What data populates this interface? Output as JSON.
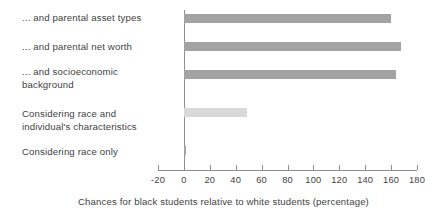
{
  "chart_data": {
    "type": "bar",
    "orientation": "horizontal",
    "title": "",
    "subtitle": "",
    "xlabel": "Chances for black students relative to white students (percentage)",
    "ylabel": "",
    "categories": [
      "... and parental asset types",
      "... and parental net worth",
      "...  and socioeconomic\nbackground",
      "Considering race and\nindividual's characteristics",
      "Considering race only"
    ],
    "values": [
      160,
      168,
      164,
      49,
      2
    ],
    "bar_colors": [
      "#a3a3a3",
      "#a3a3a3",
      "#a3a3a3",
      "#d9d9d9",
      "#a3a3a3"
    ],
    "xlim": [
      -20,
      180
    ],
    "xticks": [
      -20,
      0,
      20,
      40,
      60,
      80,
      100,
      120,
      140,
      160,
      180
    ],
    "xtick_labels": [
      "-20",
      "0",
      "20",
      "40",
      "60",
      "80",
      "100",
      "120",
      "140",
      "160",
      "180"
    ],
    "grid": false,
    "legend": null,
    "annotations": []
  },
  "colors": {
    "bar_dark": "#a3a3a3",
    "bar_light": "#d9d9d9",
    "axis": "#8f8f8f",
    "text": "#403f3f",
    "background": "#ffffff"
  }
}
